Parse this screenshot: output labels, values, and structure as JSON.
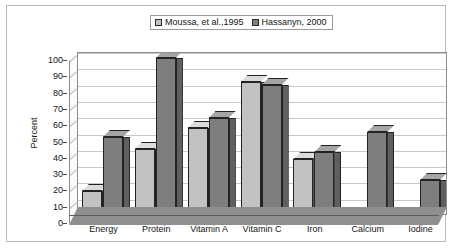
{
  "chart_data": {
    "type": "bar",
    "title": "",
    "subtitle": "",
    "xlabel": "",
    "ylabel": "Percent",
    "ylim": [
      0,
      100
    ],
    "ytick_step": 10,
    "ytick_labels": [
      "100",
      "90",
      "80",
      "70",
      "60",
      "50",
      "40",
      "30",
      "20",
      "10",
      "0"
    ],
    "grid": true,
    "legend_position": "top-center",
    "style": "3d-clustered-bar-grayscale",
    "categories": [
      "Energy",
      "Protein",
      "Vitamin A",
      "Vitamin C",
      "Iron",
      "Calcium",
      "Iodine"
    ],
    "series": [
      {
        "name": "Moussa, et al.,1995",
        "color": "#C2C2C2",
        "values": [
          14,
          40,
          53,
          81,
          34,
          0,
          0
        ]
      },
      {
        "name": "Hassanyn, 2000",
        "color": "#7E7E7E",
        "values": [
          47,
          96,
          59,
          79,
          38,
          50,
          21
        ]
      }
    ],
    "annotations": []
  },
  "legend": {
    "entries": [
      {
        "label": "Moussa, et al.,1995",
        "swatch": "light-gray-square-icon"
      },
      {
        "label": "Hassanyn, 2000",
        "swatch": "dark-gray-square-icon"
      }
    ]
  },
  "colors": {
    "series1": "#C2C2C2",
    "series2": "#7E7E7E",
    "plot_background": "#FFFFFF",
    "floor": "#8F8F8F",
    "gridline": "#C9C9C9",
    "axis": "#8C8C8C",
    "frame": "#B9B9B9",
    "text": "#141414"
  }
}
